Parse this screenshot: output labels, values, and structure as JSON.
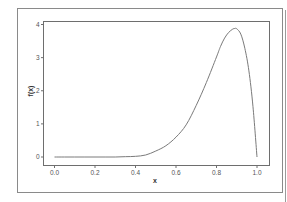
{
  "chart_data": {
    "type": "line",
    "title": "",
    "xlabel": "x",
    "ylabel": "f(x)",
    "xlim": [
      0.0,
      1.0
    ],
    "ylim": [
      0,
      4
    ],
    "x_ticks": [
      0.0,
      0.2,
      0.4,
      0.6,
      0.8,
      1.0
    ],
    "x_tick_labels": [
      "0.0",
      "0.2",
      "0.4",
      "0.6",
      "0.8",
      "1.0"
    ],
    "y_ticks": [
      0,
      1,
      2,
      3,
      4
    ],
    "y_tick_labels": [
      "0",
      "1",
      "2",
      "3",
      "4"
    ],
    "grid": false,
    "legend": "none",
    "series": [
      {
        "name": "f(x)",
        "color": "#7a7a7a",
        "x": [
          0.0,
          0.05,
          0.1,
          0.15,
          0.2,
          0.25,
          0.3,
          0.35,
          0.4,
          0.45,
          0.5,
          0.55,
          0.6,
          0.65,
          0.7,
          0.75,
          0.8,
          0.82,
          0.84,
          0.86,
          0.88,
          0.89,
          0.9,
          0.92,
          0.94,
          0.96,
          0.98,
          1.0
        ],
        "y": [
          0.0,
          0.0,
          0.0,
          0.0,
          0.0,
          0.0,
          0.0,
          0.01,
          0.02,
          0.06,
          0.18,
          0.34,
          0.6,
          0.97,
          1.56,
          2.25,
          3.02,
          3.34,
          3.59,
          3.76,
          3.86,
          3.88,
          3.87,
          3.71,
          3.28,
          2.6,
          1.53,
          0.0
        ]
      }
    ]
  }
}
